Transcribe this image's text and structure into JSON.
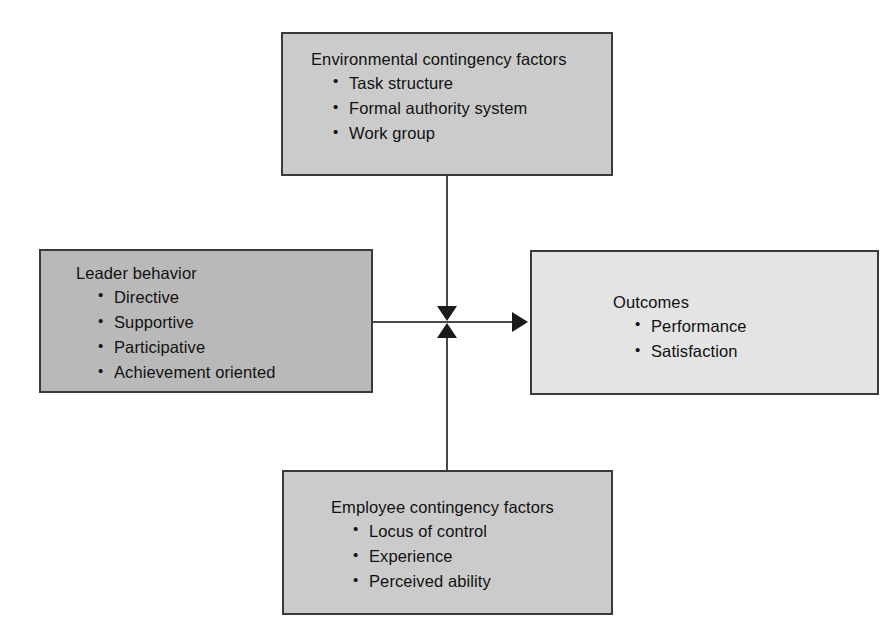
{
  "diagram": {
    "colors": {
      "box_border": "#3a3a3a",
      "fill_environmental": "#cbcbcb",
      "fill_leader": "#b9b9b9",
      "fill_outcomes": "#e4e4e4",
      "fill_employee": "#cbcbcb",
      "connector": "#4a4a4a",
      "arrowhead": "#1b1b1b",
      "background": "#ffffff",
      "text": "#111111"
    },
    "boxes": {
      "environmental": {
        "title": "Environmental contingency factors",
        "bullets": [
          "Task structure",
          "Formal authority system",
          "Work group"
        ]
      },
      "leader": {
        "title": "Leader behavior",
        "bullets": [
          "Directive",
          "Supportive",
          "Participative",
          "Achievement oriented"
        ]
      },
      "outcomes": {
        "title": "Outcomes",
        "bullets": [
          "Performance",
          "Satisfaction"
        ]
      },
      "employee": {
        "title": "Employee contingency factors",
        "bullets": [
          "Locus of control",
          "Experience",
          "Perceived ability"
        ]
      }
    },
    "connectors": [
      {
        "name": "environmental-to-junction",
        "from": "environmental",
        "to": "junction",
        "direction": "down",
        "arrowhead": true
      },
      {
        "name": "employee-to-junction",
        "from": "employee",
        "to": "junction",
        "direction": "up",
        "arrowhead": true
      },
      {
        "name": "leader-to-outcomes",
        "from": "leader",
        "to": "outcomes",
        "direction": "right",
        "arrowhead": true
      }
    ]
  }
}
